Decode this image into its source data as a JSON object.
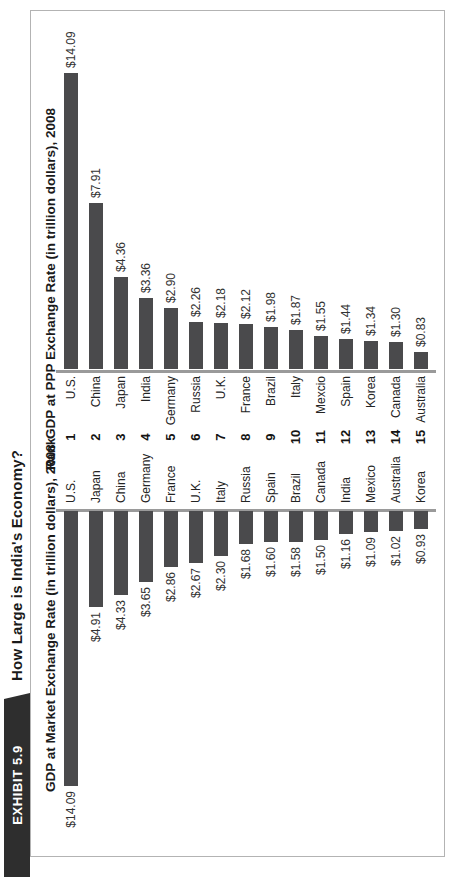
{
  "header": {
    "exhibit_label": "EXHIBIT 5.9",
    "title": "How Large is India's Economy?"
  },
  "rank": {
    "header": "Rank",
    "values": [
      "1",
      "2",
      "3",
      "4",
      "5",
      "6",
      "7",
      "8",
      "9",
      "10",
      "11",
      "12",
      "13",
      "14",
      "15"
    ]
  },
  "chart_data": [
    {
      "type": "bar",
      "orientation": "horizontal-left",
      "title": "GDP at Market Exchange Rate (in trillion dollars), 2008",
      "unit": "trillion dollars",
      "year": "2008",
      "categories": [
        "U.S.",
        "Japan",
        "China",
        "Germany",
        "France",
        "U.K.",
        "Italy",
        "Russia",
        "Spain",
        "Brazil",
        "Canada",
        "India",
        "Mexico",
        "Australia",
        "Korea"
      ],
      "values": [
        14.09,
        4.91,
        4.33,
        3.65,
        2.86,
        2.67,
        2.3,
        1.68,
        1.6,
        1.58,
        1.5,
        1.16,
        1.09,
        1.02,
        0.93
      ],
      "value_labels": [
        "$14.09",
        "$4.91",
        "$4.33",
        "$3.65",
        "$2.86",
        "$2.67",
        "$2.30",
        "$1.68",
        "$1.60",
        "$1.58",
        "$1.50",
        "$1.16",
        "$1.09",
        "$1.02",
        "$0.93"
      ],
      "bar_color": "#4a4a4c",
      "axis_color": "#9a9a9a",
      "xlim": [
        0,
        14.5
      ],
      "grid": false,
      "legend": false
    },
    {
      "type": "bar",
      "orientation": "horizontal-right",
      "title": "GDP at PPP Exchange Rate (in trillion dollars), 2008",
      "unit": "trillion dollars",
      "year": "2008",
      "categories": [
        "U.S.",
        "China",
        "Japan",
        "India",
        "Germany",
        "Russia",
        "U.K.",
        "France",
        "Brazil",
        "Italy",
        "Mexcio",
        "Spain",
        "Korea",
        "Canada",
        "Australia"
      ],
      "values": [
        14.09,
        7.91,
        4.36,
        3.36,
        2.9,
        2.26,
        2.18,
        2.12,
        1.98,
        1.87,
        1.55,
        1.44,
        1.34,
        1.3,
        0.83
      ],
      "value_labels": [
        "$14.09",
        "$7.91",
        "$4.36",
        "$3.36",
        "$2.90",
        "$2.26",
        "$2.18",
        "$2.12",
        "$1.98",
        "$1.87",
        "$1.55",
        "$1.44",
        "$1.34",
        "$1.30",
        "$0.83"
      ],
      "bar_color": "#4a4a4c",
      "axis_color": "#9a9a9a",
      "xlim": [
        0,
        14.5
      ],
      "grid": false,
      "legend": false
    }
  ]
}
